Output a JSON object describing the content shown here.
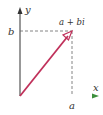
{
  "diagram": {
    "labels": {
      "y_axis": "y",
      "x_axis": "x",
      "b_tick": "b",
      "a_tick": "a",
      "point": "a + bi"
    },
    "colors": {
      "vector": "#c0305a",
      "axis": "#333333",
      "x_axis_gradient_start": "#8fd48f",
      "x_axis_gradient_mid": "#e8e870",
      "x_axis_gradient_end": "#4caf50",
      "dashed": "#666666"
    }
  }
}
